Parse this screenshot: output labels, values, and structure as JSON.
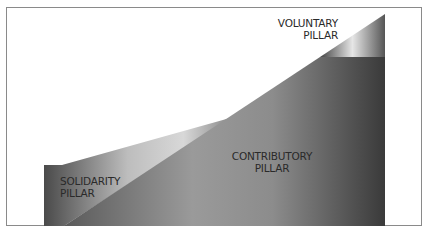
{
  "diagram": {
    "pillars": [
      {
        "id": "voluntary",
        "line1": "VOLUNTARY",
        "line2": "PILLAR"
      },
      {
        "id": "solidarity",
        "line1": "SOLIDARITY",
        "line2": "PILLAR"
      },
      {
        "id": "contributory",
        "line1": "CONTRIBUTORY",
        "line2": "PILLAR"
      }
    ]
  }
}
